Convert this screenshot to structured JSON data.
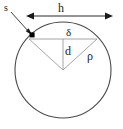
{
  "figure": {
    "type": "geometric-diagram",
    "background_color": "#ffffff",
    "stroke_color": "#3a3a3a",
    "thin_stroke_color": "#8a8a8a",
    "marker_color": "#000000",
    "labels": {
      "s": "s",
      "h": "h",
      "delta": "δ",
      "d": "d",
      "rho": "ρ"
    },
    "geometry": {
      "circle": {
        "cx": 63,
        "cy": 70,
        "r": 48
      },
      "chord": {
        "x1": 29,
        "y1": 39,
        "x2": 97,
        "y2": 39
      },
      "center_point": {
        "x": 63,
        "y": 70
      },
      "marker_point": {
        "x": 32,
        "y": 35
      },
      "dimension_arrow": {
        "x1": 27,
        "x2": 112,
        "y": 16
      },
      "leader_line": {
        "x1": 11,
        "y1": 12,
        "x2": 31,
        "y2": 34
      },
      "radius_left": {
        "x1": 63,
        "y1": 70,
        "x2": 29,
        "y2": 39
      },
      "radius_right": {
        "x1": 63,
        "y1": 70,
        "x2": 97,
        "y2": 39
      },
      "vertical_segment": {
        "x1": 63,
        "y1": 39,
        "x2": 63,
        "y2": 70
      }
    }
  }
}
